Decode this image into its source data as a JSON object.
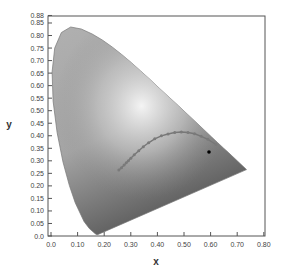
{
  "chart_data": {
    "type": "scatter",
    "title": "",
    "subtitle": "CIE 1931 chromaticity diagram with Planckian locus and sample point",
    "xlabel": "x",
    "ylabel": "y",
    "xlim": [
      0.0,
      0.8
    ],
    "ylim": [
      0.0,
      0.88
    ],
    "grid": false,
    "legend": null,
    "x_ticks": [
      "0.0",
      "0.10",
      "0.20",
      "0.30",
      "0.40",
      "0.50",
      "0.60",
      "0.70",
      "0.80"
    ],
    "y_ticks": [
      "0.0",
      "0.05",
      "0.10",
      "0.15",
      "0.20",
      "0.25",
      "0.30",
      "0.35",
      "0.40",
      "0.45",
      "0.50",
      "0.55",
      "0.60",
      "0.65",
      "0.70",
      "0.75",
      "0.80",
      "0.85",
      "0.88"
    ],
    "series": [
      {
        "name": "spectral locus (gamut outline)",
        "type": "area",
        "color": "#9a9a9a",
        "points": [
          [
            0.175,
            0.005
          ],
          [
            0.172,
            0.005
          ],
          [
            0.166,
            0.009
          ],
          [
            0.144,
            0.03
          ],
          [
            0.124,
            0.058
          ],
          [
            0.091,
            0.133
          ],
          [
            0.069,
            0.201
          ],
          [
            0.045,
            0.295
          ],
          [
            0.023,
            0.413
          ],
          [
            0.008,
            0.538
          ],
          [
            0.004,
            0.655
          ],
          [
            0.014,
            0.75
          ],
          [
            0.039,
            0.812
          ],
          [
            0.074,
            0.834
          ],
          [
            0.114,
            0.826
          ],
          [
            0.155,
            0.806
          ],
          [
            0.193,
            0.782
          ],
          [
            0.23,
            0.754
          ],
          [
            0.266,
            0.724
          ],
          [
            0.302,
            0.692
          ],
          [
            0.337,
            0.659
          ],
          [
            0.373,
            0.624
          ],
          [
            0.408,
            0.589
          ],
          [
            0.444,
            0.554
          ],
          [
            0.479,
            0.52
          ],
          [
            0.512,
            0.487
          ],
          [
            0.545,
            0.454
          ],
          [
            0.575,
            0.424
          ],
          [
            0.603,
            0.396
          ],
          [
            0.627,
            0.372
          ],
          [
            0.648,
            0.351
          ],
          [
            0.666,
            0.334
          ],
          [
            0.68,
            0.32
          ],
          [
            0.692,
            0.308
          ],
          [
            0.701,
            0.299
          ],
          [
            0.735,
            0.265
          ]
        ]
      },
      {
        "name": "Planckian locus",
        "type": "line",
        "color": "#777777",
        "points": [
          [
            0.255,
            0.263
          ],
          [
            0.265,
            0.272
          ],
          [
            0.275,
            0.283
          ],
          [
            0.283,
            0.292
          ],
          [
            0.291,
            0.3
          ],
          [
            0.3,
            0.31
          ],
          [
            0.313,
            0.324
          ],
          [
            0.33,
            0.34
          ],
          [
            0.347,
            0.356
          ],
          [
            0.367,
            0.372
          ],
          [
            0.39,
            0.388
          ],
          [
            0.415,
            0.4
          ],
          [
            0.44,
            0.407
          ],
          [
            0.465,
            0.413
          ],
          [
            0.49,
            0.415
          ],
          [
            0.515,
            0.413
          ],
          [
            0.54,
            0.408
          ],
          [
            0.565,
            0.398
          ],
          [
            0.59,
            0.386
          ],
          [
            0.62,
            0.365
          ]
        ]
      },
      {
        "name": "sample point",
        "type": "scatter",
        "color": "#000000",
        "points": [
          [
            0.594,
            0.335
          ]
        ]
      }
    ]
  },
  "axes": {
    "x_label": "x",
    "y_label": "y"
  }
}
